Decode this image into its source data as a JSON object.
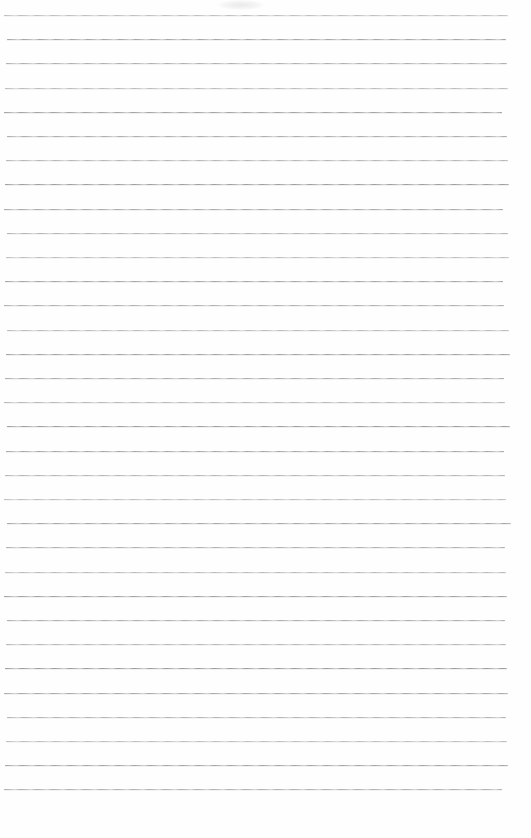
{
  "page": {
    "kind": "blank-ruled-notebook-page",
    "text_content": "",
    "background_color": "#fefefe",
    "ruling": {
      "line_count": 33,
      "first_line_y": 15,
      "line_spacing": 24.2,
      "line_left": 4,
      "line_right": 508,
      "line_color": "#b5b5b5"
    },
    "artifacts": [
      {
        "name": "scan-smudge",
        "x": 218,
        "y": 0,
        "width": 46,
        "height": 10
      }
    ]
  }
}
